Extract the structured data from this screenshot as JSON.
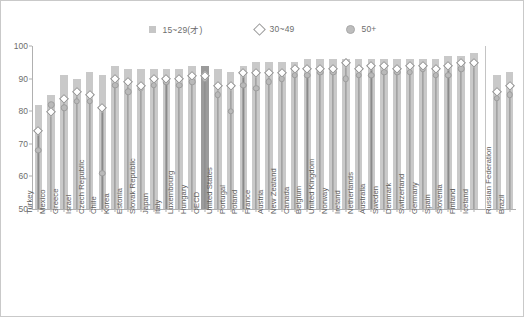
{
  "chart_data": {
    "type": "bar",
    "title": "",
    "xlabel": "",
    "ylabel": "",
    "ylim": [
      50,
      100
    ],
    "yticks": [
      50,
      60,
      70,
      80,
      90,
      100
    ],
    "grid": false,
    "legend_position": "top-center",
    "highlight_category": "OECD",
    "separator_after": "Iceland",
    "legend": [
      {
        "name": "15~29(才)",
        "marker": "bar",
        "color": "#c9c9c9"
      },
      {
        "name": "30~49",
        "marker": "diamond",
        "color": "#ffffff"
      },
      {
        "name": "50+",
        "marker": "circle",
        "color": "#b9b9b9"
      }
    ],
    "categories": [
      "Turkey",
      "Mexico",
      "Greece",
      "Israel",
      "Czech Republic",
      "Chile",
      "Korea",
      "Estonia",
      "Slovak Republic",
      "Japan",
      "Italy",
      "Luxembourg",
      "Hungary",
      "OECD",
      "United States",
      "Portugal",
      "Poland",
      "France",
      "Austria",
      "New Zealand",
      "Canada",
      "Belgium",
      "United Kingdom",
      "Norway",
      "Ireland",
      "Netherlands",
      "Australia",
      "Sweden",
      "Denmark",
      "Switzerland",
      "Germany",
      "Spain",
      "Slovenia",
      "Finland",
      "Iceland",
      "Russian Federation",
      "Brazil"
    ],
    "series": [
      {
        "name": "15~29(才)",
        "values": [
          82,
          85,
          91,
          90,
          92,
          91,
          94,
          93,
          93,
          93,
          93,
          93,
          94,
          94,
          93,
          92,
          94,
          95,
          95,
          95,
          95,
          96,
          96,
          96,
          96,
          96,
          96,
          96,
          96,
          96,
          96,
          96,
          97,
          97,
          98,
          91,
          92
        ]
      },
      {
        "name": "30~49",
        "values": [
          74,
          80,
          84,
          86,
          85,
          81,
          90,
          89,
          88,
          90,
          90,
          90,
          91,
          91,
          88,
          88,
          92,
          92,
          92,
          92,
          93,
          93,
          93,
          93,
          95,
          93,
          94,
          94,
          93,
          94,
          94,
          93,
          94,
          95,
          95,
          86,
          88
        ]
      },
      {
        "name": "50+",
        "values": [
          68,
          82,
          81,
          83,
          83,
          61,
          88,
          86,
          87,
          88,
          89,
          88,
          89,
          90,
          85,
          80,
          88,
          87,
          89,
          90,
          91,
          91,
          92,
          92,
          90,
          91,
          91,
          92,
          92,
          92,
          93,
          91,
          91,
          93,
          95,
          84,
          85
        ]
      }
    ]
  }
}
